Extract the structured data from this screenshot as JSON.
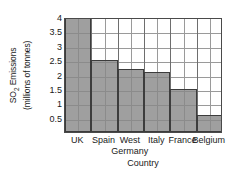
{
  "chart_data": {
    "type": "bar",
    "title": "",
    "categories": [
      "UK",
      "Spain",
      "West Germany",
      "Italy",
      "France",
      "Belgium"
    ],
    "category_lines": [
      [
        "UK"
      ],
      [
        "Spain"
      ],
      [
        "West",
        "Germany"
      ],
      [
        "Italy"
      ],
      [
        "France"
      ],
      [
        "Belgium"
      ]
    ],
    "values": [
      4,
      2.5,
      2.2,
      2.1,
      1.5,
      0.6
    ],
    "xlabel": "Country",
    "ylabel": "SO2 Emissions (millions of tonnes)",
    "ylabel_line1": "SO",
    "ylabel_line1_sub": "2",
    "ylabel_line1_rest": " Emissions",
    "ylabel_line2": "(millions of tonnes)",
    "ylim": [
      0,
      4
    ],
    "yticks": [
      0.5,
      1,
      1.5,
      2,
      2.5,
      3,
      3.5,
      4
    ],
    "ytick_labels": [
      "0.5",
      "1",
      "1.5",
      "2",
      "2.5",
      "3",
      "3.5",
      "4"
    ],
    "grid": true,
    "minor_vertical_gridlines": true,
    "legend": "none",
    "bar_fill_color": "#878787",
    "bar_edge_color": "#3c3c3c",
    "grid_color": "#9a9a9a",
    "axis_color": "#4a4a4a",
    "background_color": "#ffffff"
  }
}
